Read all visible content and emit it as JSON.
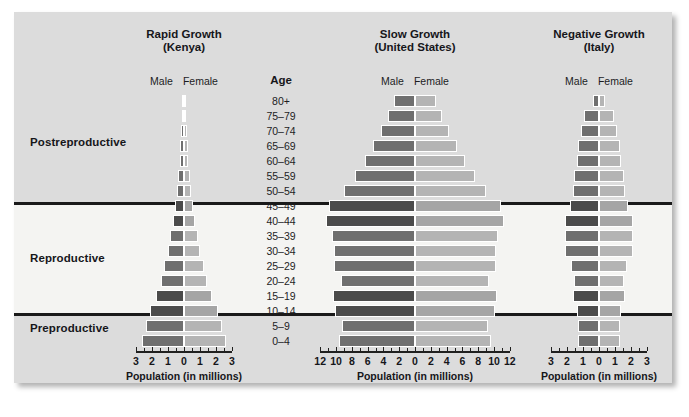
{
  "figure": {
    "background": "#ffffff",
    "panel_color": "#dcdcdc",
    "reproductive_band_color": "#f4f4f2",
    "male_color": "#6f6f6f",
    "female_color": "#b4b4b4",
    "stage_labels": {
      "postreproductive": "Postreproductive",
      "reproductive": "Reproductive",
      "preproductive": "Preproductive"
    },
    "age_header": "Age",
    "legend_male": "Male",
    "legend_female": "Female",
    "axis_caption": "Population (in millions)"
  },
  "chart_data": [
    {
      "type": "bar",
      "orientation": "population-pyramid",
      "title": "Rapid Growth",
      "subtitle": "(Kenya)",
      "country": "Kenya",
      "xlabel": "Population (in millions)",
      "ylabel": "Age",
      "xlim": [
        -3,
        3
      ],
      "xticks": [
        -3,
        -2,
        -1,
        0,
        1,
        2,
        3
      ],
      "xtick_labels": [
        "3",
        "2",
        "1",
        "0",
        "1",
        "2",
        "3"
      ],
      "grid": false,
      "legend": [
        "Male",
        "Female"
      ],
      "categories": [
        "80+",
        "75–79",
        "70–74",
        "65–69",
        "60–64",
        "55–59",
        "50–54",
        "45–49",
        "40–44",
        "35–39",
        "30–34",
        "25–29",
        "20–24",
        "15–19",
        "10–14",
        "5–9",
        "0–4"
      ],
      "series": [
        {
          "name": "Male",
          "values": [
            0.1,
            0.13,
            0.17,
            0.22,
            0.28,
            0.35,
            0.44,
            0.55,
            0.68,
            0.85,
            1.03,
            1.22,
            1.45,
            1.78,
            2.1,
            2.35,
            2.65
          ]
        },
        {
          "name": "Female",
          "values": [
            0.1,
            0.13,
            0.17,
            0.22,
            0.28,
            0.35,
            0.44,
            0.55,
            0.68,
            0.85,
            1.03,
            1.22,
            1.45,
            1.78,
            2.1,
            2.35,
            2.65
          ]
        }
      ]
    },
    {
      "type": "bar",
      "orientation": "population-pyramid",
      "title": "Slow Growth",
      "subtitle": "(United States)",
      "country": "United States",
      "xlabel": "Population (in millions)",
      "ylabel": "Age",
      "xlim": [
        -12,
        12
      ],
      "xticks": [
        -12,
        -10,
        -8,
        -6,
        -4,
        -2,
        0,
        2,
        4,
        6,
        8,
        10,
        12
      ],
      "xtick_labels": [
        "12",
        "10",
        "8",
        "6",
        "4",
        "2",
        "0",
        "2",
        "4",
        "6",
        "8",
        "10",
        "12"
      ],
      "grid": false,
      "legend": [
        "Male",
        "Female"
      ],
      "categories": [
        "80+",
        "75–79",
        "70–74",
        "65–69",
        "60–64",
        "55–59",
        "50–54",
        "45–49",
        "40–44",
        "35–39",
        "30–34",
        "25–29",
        "20–24",
        "15–19",
        "10–14",
        "5–9",
        "0–4"
      ],
      "series": [
        {
          "name": "Male",
          "values": [
            2.6,
            3.4,
            4.3,
            5.3,
            6.3,
            7.6,
            9.0,
            10.9,
            11.3,
            10.5,
            10.3,
            10.2,
            9.4,
            10.4,
            10.1,
            9.2,
            9.6
          ]
        },
        {
          "name": "Female",
          "values": [
            2.6,
            3.4,
            4.3,
            5.3,
            6.3,
            7.6,
            9.0,
            10.9,
            11.3,
            10.5,
            10.3,
            10.2,
            9.4,
            10.4,
            10.1,
            9.2,
            9.6
          ]
        }
      ]
    },
    {
      "type": "bar",
      "orientation": "population-pyramid",
      "title": "Negative Growth",
      "subtitle": "(Italy)",
      "country": "Italy",
      "xlabel": "Population (in millions)",
      "ylabel": "Age",
      "xlim": [
        -3,
        3
      ],
      "xticks": [
        -3,
        -2,
        -1,
        0,
        1,
        2,
        3
      ],
      "xtick_labels": [
        "3",
        "2",
        "1",
        "0",
        "1",
        "2",
        "3"
      ],
      "grid": false,
      "legend": [
        "Male",
        "Female"
      ],
      "categories": [
        "80+",
        "75–79",
        "70–74",
        "65–69",
        "60–64",
        "55–59",
        "50–54",
        "45–49",
        "40–44",
        "35–39",
        "30–34",
        "25–29",
        "20–24",
        "15–19",
        "10–14",
        "5–9",
        "0–4"
      ],
      "series": [
        {
          "name": "Male",
          "values": [
            0.35,
            0.95,
            1.1,
            1.3,
            1.35,
            1.55,
            1.6,
            1.8,
            2.1,
            2.15,
            2.15,
            1.75,
            1.55,
            1.65,
            1.35,
            1.3,
            1.3
          ]
        },
        {
          "name": "Female",
          "values": [
            0.35,
            0.95,
            1.1,
            1.3,
            1.35,
            1.55,
            1.6,
            1.8,
            2.1,
            2.15,
            2.15,
            1.75,
            1.55,
            1.65,
            1.35,
            1.3,
            1.3
          ]
        }
      ]
    }
  ]
}
